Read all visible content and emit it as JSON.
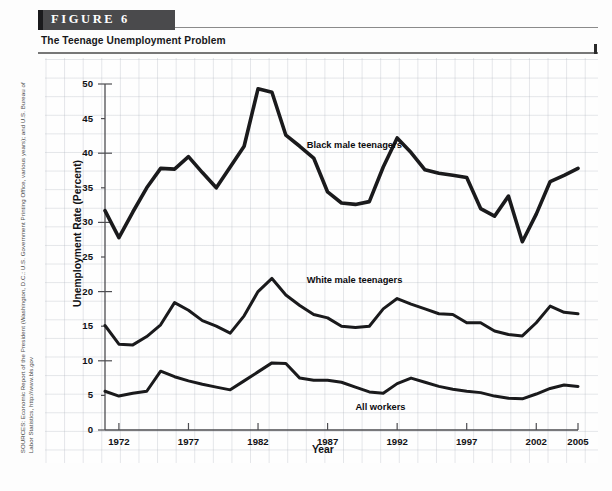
{
  "figure": {
    "tab_label": "FIGURE  6",
    "subtitle": "The Teenage Unemployment Problem"
  },
  "sources": {
    "text": "SOURCES: Economic Report of the President (Washington, D.C.: U.S. Government Printing Office, various years); and U.S. Bureau of Labor Statistics, http://www.bls.gov"
  },
  "chart_data": {
    "type": "line",
    "title": "The Teenage Unemployment Problem",
    "xlabel": "Year",
    "ylabel": "Unemployment Rate (Percent)",
    "xlim": [
      1971,
      2005
    ],
    "ylim": [
      0,
      50
    ],
    "xticks": [
      1972,
      1977,
      1982,
      1987,
      1992,
      1997,
      2002,
      2005
    ],
    "yticks": [
      0,
      5,
      10,
      15,
      20,
      25,
      30,
      35,
      40,
      45,
      50
    ],
    "grid": true,
    "legend_position": "inline-annotations",
    "line_color": "#1a1a1c",
    "x": [
      1971,
      1972,
      1973,
      1974,
      1975,
      1976,
      1977,
      1978,
      1979,
      1980,
      1981,
      1982,
      1983,
      1984,
      1985,
      1986,
      1987,
      1988,
      1989,
      1990,
      1991,
      1992,
      1993,
      1994,
      1995,
      1996,
      1997,
      1998,
      1999,
      2000,
      2001,
      2002,
      2003,
      2004,
      2005
    ],
    "series": [
      {
        "name": "Black male teenagers",
        "values": [
          31.7,
          27.8,
          31.5,
          35.0,
          37.8,
          37.7,
          39.5,
          37.2,
          35.0,
          38.0,
          41.0,
          49.3,
          48.8,
          42.6,
          41.0,
          39.3,
          34.4,
          32.8,
          32.6,
          33.0,
          38.0,
          42.2,
          40.1,
          37.6,
          37.1,
          36.8,
          36.5,
          32.0,
          30.9,
          33.8,
          27.2,
          31.2,
          35.9,
          36.8,
          37.8
        ]
      },
      {
        "name": "White male teenagers",
        "values": [
          15.1,
          12.4,
          12.3,
          13.5,
          15.2,
          18.4,
          17.3,
          15.8,
          15.0,
          14.0,
          16.5,
          20.0,
          21.9,
          19.5,
          18.0,
          16.7,
          16.2,
          15.0,
          14.8,
          15.0,
          17.5,
          19.0,
          18.2,
          17.5,
          16.8,
          16.7,
          15.5,
          15.5,
          14.3,
          13.8,
          13.6,
          15.5,
          17.9,
          17.0,
          16.8
        ]
      },
      {
        "name": "All workers",
        "values": [
          5.6,
          4.9,
          5.3,
          5.6,
          8.5,
          7.7,
          7.1,
          6.6,
          6.2,
          5.8,
          7.1,
          8.4,
          9.7,
          9.6,
          7.5,
          7.2,
          7.2,
          6.9,
          6.2,
          5.5,
          5.3,
          6.7,
          7.5,
          6.9,
          6.3,
          5.9,
          5.6,
          5.4,
          4.9,
          4.6,
          4.5,
          5.2,
          6.0,
          6.5,
          6.3
        ]
      }
    ],
    "annotations": [
      {
        "label": "Black male teenagers",
        "x": 1985.5,
        "y": 41.0
      },
      {
        "label": "White male teenagers",
        "x": 1985.5,
        "y": 21.5
      },
      {
        "label": "All workers",
        "x": 1989.0,
        "y": 3.2
      }
    ]
  }
}
